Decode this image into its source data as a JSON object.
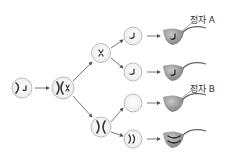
{
  "diagram": {
    "title": "",
    "labels": {
      "sperm_a": "정자 A",
      "sperm_b": "정자 B"
    },
    "colors": {
      "cell_fill": "#f3f3f3",
      "cell_stroke": "#b5b5b5",
      "chromosome": "#333333",
      "sperm_head": "#8f8f8f",
      "arrow": "#555555"
    },
    "nodes": [
      {
        "id": "parent-cell",
        "chromosomes": "ㅅ ╯"
      },
      {
        "id": "replicated-cell",
        "chromosomes": "X x"
      },
      {
        "id": "secondary-cell-top",
        "chromosomes": "x"
      },
      {
        "id": "secondary-cell-bottom",
        "chromosomes": "X"
      },
      {
        "id": "spermatid-1",
        "chromosomes": "╯"
      },
      {
        "id": "spermatid-2",
        "chromosomes": "╯"
      },
      {
        "id": "spermatid-3",
        "chromosomes": ""
      },
      {
        "id": "spermatid-4",
        "chromosomes": "))"
      },
      {
        "id": "sperm-1",
        "label": "정자 A"
      },
      {
        "id": "sperm-2",
        "label": ""
      },
      {
        "id": "sperm-3",
        "label": "정자 B"
      },
      {
        "id": "sperm-4",
        "label": ""
      }
    ]
  }
}
